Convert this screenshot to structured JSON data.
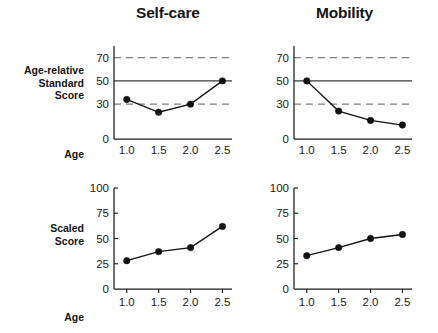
{
  "panels": {
    "self_care_title": "Self-care",
    "mobility_title": "Mobility"
  },
  "row_labels": {
    "age_relative_standard_score": "Age-relative\nStandard\nScore",
    "age_relative_line1": "Age-relative",
    "age_relative_line2": "Standard",
    "age_relative_line3": "Score",
    "scaled_line1": "Scaled",
    "scaled_line2": "Score",
    "age_top": "Age",
    "age_bottom": "Age"
  },
  "axis_ticks": {
    "top_y": [
      "70",
      "50",
      "30",
      "0"
    ],
    "bottom_y": [
      "100",
      "75",
      "50",
      "25",
      "0"
    ],
    "x": [
      "1.0",
      "1.5",
      "2.0",
      "2.5"
    ]
  },
  "colors": {
    "axis": "#1c1c1c",
    "reference_solid": "#3a3a3a",
    "reference_dashed": "#7d7d7d",
    "series": "#111111",
    "text": "#151515",
    "background": "#ffffff"
  },
  "chart_data": [
    {
      "id": "self-care-age-relative-standard-score",
      "type": "line",
      "title": "Self-care",
      "xlabel": "Age",
      "ylabel": "Age-relative Standard Score",
      "x": [
        1.0,
        1.5,
        2.0,
        2.5
      ],
      "xtick_labels": [
        "1.0",
        "1.5",
        "2.0",
        "2.5"
      ],
      "values": [
        34,
        23,
        30,
        50
      ],
      "ytick_labels": [
        "70",
        "50",
        "30",
        "0"
      ],
      "yticks": [
        70,
        50,
        30,
        0
      ],
      "ylim": [
        0,
        80
      ],
      "xlim": [
        0.8,
        2.65
      ],
      "grid": false,
      "reference_lines": [
        {
          "value": 70,
          "style": "dashed"
        },
        {
          "value": 50,
          "style": "solid"
        },
        {
          "value": 30,
          "style": "dashed"
        }
      ],
      "markers": "filled-circle",
      "legend": "none"
    },
    {
      "id": "mobility-age-relative-standard-score",
      "type": "line",
      "title": "Mobility",
      "xlabel": "Age",
      "ylabel": "Age-relative Standard Score",
      "x": [
        1.0,
        1.5,
        2.0,
        2.5
      ],
      "xtick_labels": [
        "1.0",
        "1.5",
        "2.0",
        "2.5"
      ],
      "values": [
        50,
        24,
        16,
        12
      ],
      "ytick_labels": [
        "70",
        "50",
        "30",
        "0"
      ],
      "yticks": [
        70,
        50,
        30,
        0
      ],
      "ylim": [
        0,
        80
      ],
      "xlim": [
        0.8,
        2.65
      ],
      "grid": false,
      "reference_lines": [
        {
          "value": 70,
          "style": "dashed"
        },
        {
          "value": 50,
          "style": "solid"
        },
        {
          "value": 30,
          "style": "dashed"
        }
      ],
      "markers": "filled-circle",
      "legend": "none"
    },
    {
      "id": "self-care-scaled-score",
      "type": "line",
      "title": "Self-care",
      "xlabel": "Age",
      "ylabel": "Scaled Score",
      "x": [
        1.0,
        1.5,
        2.0,
        2.5
      ],
      "xtick_labels": [
        "1.0",
        "1.5",
        "2.0",
        "2.5"
      ],
      "values": [
        28,
        37,
        41,
        62
      ],
      "ytick_labels": [
        "100",
        "75",
        "50",
        "25",
        "0"
      ],
      "yticks": [
        100,
        75,
        50,
        25,
        0
      ],
      "ylim": [
        0,
        100
      ],
      "xlim": [
        0.8,
        2.65
      ],
      "grid": false,
      "reference_lines": [],
      "markers": "filled-circle",
      "legend": "none"
    },
    {
      "id": "mobility-scaled-score",
      "type": "line",
      "title": "Mobility",
      "xlabel": "Age",
      "ylabel": "Scaled Score",
      "x": [
        1.0,
        1.5,
        2.0,
        2.5
      ],
      "xtick_labels": [
        "1.0",
        "1.5",
        "2.0",
        "2.5"
      ],
      "values": [
        33,
        41,
        50,
        54
      ],
      "ytick_labels": [
        "100",
        "75",
        "50",
        "25",
        "0"
      ],
      "yticks": [
        100,
        75,
        50,
        25,
        0
      ],
      "ylim": [
        0,
        100
      ],
      "xlim": [
        0.8,
        2.65
      ],
      "grid": false,
      "reference_lines": [],
      "markers": "filled-circle",
      "legend": "none"
    }
  ]
}
